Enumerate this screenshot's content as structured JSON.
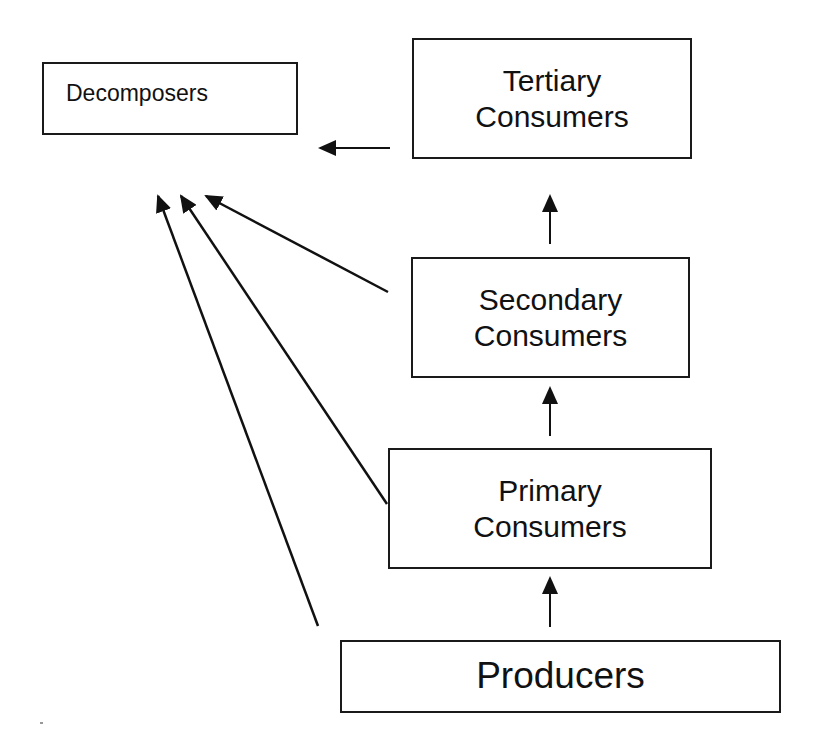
{
  "diagram": {
    "nodes": [
      {
        "id": "decomposers",
        "lines": [
          "Decomposers"
        ]
      },
      {
        "id": "tertiary",
        "lines": [
          "Tertiary",
          "Consumers"
        ]
      },
      {
        "id": "secondary",
        "lines": [
          "Secondary",
          "Consumers"
        ]
      },
      {
        "id": "primary",
        "lines": [
          "Primary",
          "Consumers"
        ]
      },
      {
        "id": "producers",
        "lines": [
          "Producers"
        ]
      }
    ],
    "edges": [
      {
        "from": "producers",
        "to": "primary"
      },
      {
        "from": "primary",
        "to": "secondary"
      },
      {
        "from": "secondary",
        "to": "tertiary"
      },
      {
        "from": "tertiary",
        "to": "decomposers"
      },
      {
        "from": "secondary",
        "to": "decomposers"
      },
      {
        "from": "primary",
        "to": "decomposers"
      },
      {
        "from": "producers",
        "to": "decomposers"
      }
    ],
    "colors": {
      "stroke": "#1a1a1a",
      "background": "#ffffff"
    }
  }
}
